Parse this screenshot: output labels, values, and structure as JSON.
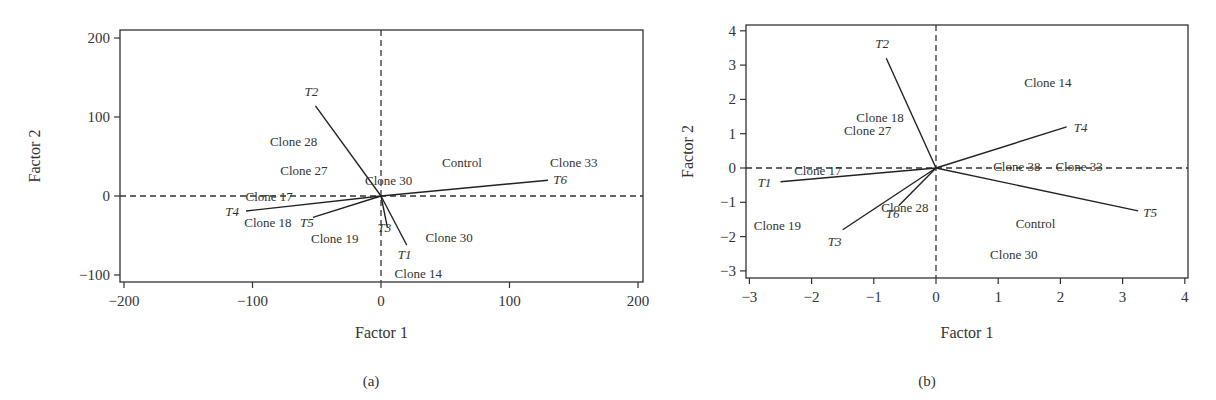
{
  "chart_data": [
    {
      "id": "a",
      "type": "scatter",
      "subtype": "biplot",
      "caption": "(a)",
      "title": "",
      "xlabel": "Factor 1",
      "ylabel": "Factor 2",
      "xlim": [
        -205,
        205
      ],
      "ylim": [
        -110,
        210
      ],
      "xticks": [
        -200,
        -100,
        0,
        100,
        200
      ],
      "yticks": [
        -100,
        0,
        100,
        200
      ],
      "xtick_labels": [
        "−200",
        "−100",
        "0",
        "100",
        "200"
      ],
      "ytick_labels": [
        "−100",
        "0",
        "100",
        "200"
      ],
      "grid": false,
      "reference_lines": {
        "x": 0,
        "y": 0,
        "style": "dashed"
      },
      "vectors": [
        {
          "name": "T1",
          "x": 20,
          "y": -62
        },
        {
          "name": "T2",
          "x": -51,
          "y": 114
        },
        {
          "name": "T3",
          "x": 5,
          "y": -40
        },
        {
          "name": "T4",
          "x": -105,
          "y": -19
        },
        {
          "name": "T5",
          "x": -53,
          "y": -27
        },
        {
          "name": "T6",
          "x": 130,
          "y": 20
        }
      ],
      "points": [
        {
          "label": "Clone 28",
          "x": -68,
          "y": 70
        },
        {
          "label": "Clone 27",
          "x": -60,
          "y": 33
        },
        {
          "label": "Clone 17",
          "x": -87,
          "y": 0
        },
        {
          "label": "Clone 18",
          "x": -88,
          "y": -33
        },
        {
          "label": "Clone 19",
          "x": -36,
          "y": -53
        },
        {
          "label": "Control",
          "x": 63,
          "y": 43
        },
        {
          "label": "Clone 30",
          "x": 6,
          "y": 20
        },
        {
          "label": "Clone 33",
          "x": 150,
          "y": 43
        },
        {
          "label": "Clone 30",
          "x": 53,
          "y": -52
        },
        {
          "label": "Clone 14",
          "x": 29,
          "y": -97
        }
      ]
    },
    {
      "id": "b",
      "type": "scatter",
      "subtype": "biplot",
      "caption": "(b)",
      "title": "",
      "xlabel": "Factor 1",
      "ylabel": "Factor 2",
      "xlim": [
        -3.05,
        4.05
      ],
      "ylim": [
        -3.2,
        4.2
      ],
      "xticks": [
        -3,
        -2,
        -1,
        0,
        1,
        2,
        3,
        4
      ],
      "yticks": [
        -3,
        -2,
        -1,
        0,
        1,
        2,
        3,
        4
      ],
      "xtick_labels": [
        "−3",
        "−2",
        "−1",
        "0",
        "1",
        "2",
        "3",
        "4"
      ],
      "ytick_labels": [
        "−3",
        "−2",
        "−1",
        "0",
        "1",
        "2",
        "3",
        "4"
      ],
      "grid": false,
      "reference_lines": {
        "x": 0,
        "y": 0,
        "style": "dashed"
      },
      "vectors": [
        {
          "name": "T1",
          "x": -2.5,
          "y": -0.4
        },
        {
          "name": "T2",
          "x": -0.8,
          "y": 3.2
        },
        {
          "name": "T3",
          "x": -1.5,
          "y": -1.8
        },
        {
          "name": "T4",
          "x": 2.1,
          "y": 1.2
        },
        {
          "name": "T5",
          "x": 3.25,
          "y": -1.25
        },
        {
          "name": "T6",
          "x": -0.6,
          "y": -1.1
        }
      ],
      "points": [
        {
          "label": "Clone 18",
          "x": -0.9,
          "y": 1.5
        },
        {
          "label": "Clone 27",
          "x": -1.1,
          "y": 1.1
        },
        {
          "label": "Clone 17",
          "x": -1.9,
          "y": -0.05
        },
        {
          "label": "Clone 19",
          "x": -2.55,
          "y": -1.65
        },
        {
          "label": "Clone 28",
          "x": -0.5,
          "y": -1.15
        },
        {
          "label": "Clone 14",
          "x": 1.8,
          "y": 2.5
        },
        {
          "label": "Clone 38",
          "x": 1.3,
          "y": 0.05
        },
        {
          "label": "Clone 33",
          "x": 2.3,
          "y": 0.05
        },
        {
          "label": "Control",
          "x": 1.6,
          "y": -1.6
        },
        {
          "label": "Clone 30",
          "x": 1.25,
          "y": -2.5
        }
      ]
    }
  ]
}
